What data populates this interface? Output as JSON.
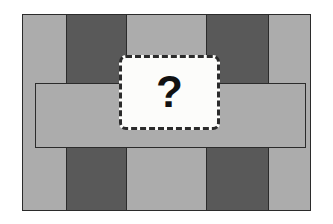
{
  "figure": {
    "type": "grid-diagram",
    "background_color": "#ffffff"
  },
  "palette": {
    "light_gray": "#acacac",
    "dark_gray": "#595959",
    "outline": "#2b2b2b",
    "card_fill": "#fcfcfa",
    "card_border": "#2b2b2b",
    "qmark_color": "#111111"
  },
  "grid": {
    "name": "outer-grid",
    "x": 22,
    "y": 14,
    "width": 289,
    "height": 197,
    "columns": 5,
    "rows": 3,
    "column_edges": [
      22,
      66,
      127,
      206,
      269,
      311
    ],
    "row_edges": [
      14,
      83,
      148,
      211
    ],
    "cells": [
      {
        "row": 0,
        "col": 0,
        "fill": "light_gray"
      },
      {
        "row": 0,
        "col": 1,
        "fill": "dark_gray"
      },
      {
        "row": 0,
        "col": 2,
        "fill": "light_gray"
      },
      {
        "row": 0,
        "col": 3,
        "fill": "dark_gray"
      },
      {
        "row": 0,
        "col": 4,
        "fill": "light_gray"
      },
      {
        "row": 1,
        "col": 0,
        "fill": "light_gray"
      },
      {
        "row": 1,
        "col": 1,
        "fill": "light_gray"
      },
      {
        "row": 1,
        "col": 2,
        "fill": "light_gray"
      },
      {
        "row": 1,
        "col": 3,
        "fill": "light_gray"
      },
      {
        "row": 1,
        "col": 4,
        "fill": "light_gray"
      },
      {
        "row": 2,
        "col": 0,
        "fill": "light_gray"
      },
      {
        "row": 2,
        "col": 1,
        "fill": "dark_gray"
      },
      {
        "row": 2,
        "col": 2,
        "fill": "light_gray"
      },
      {
        "row": 2,
        "col": 3,
        "fill": "dark_gray"
      },
      {
        "row": 2,
        "col": 4,
        "fill": "light_gray"
      }
    ]
  },
  "inner_rect": {
    "name": "middle-band-outline",
    "x": 35,
    "y": 83,
    "width": 271,
    "height": 65,
    "stroke": "#2b2b2b"
  },
  "unknown_card": {
    "label": "?",
    "x": 119,
    "y": 55,
    "width": 101,
    "height": 75,
    "border_style": "dashed",
    "corner_radius": 7
  }
}
